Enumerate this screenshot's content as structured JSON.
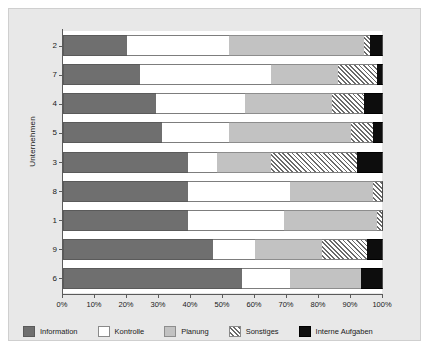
{
  "chart_data": {
    "type": "bar",
    "orientation": "horizontal",
    "stacked": true,
    "normalized": true,
    "title": "",
    "xlabel": "",
    "ylabel": "Unternehmen",
    "xlim": [
      0,
      100
    ],
    "xticks": [
      "0%",
      "10%",
      "20%",
      "30%",
      "40%",
      "50%",
      "60%",
      "70%",
      "80%",
      "90%",
      "100%"
    ],
    "xtick_values": [
      0,
      10,
      20,
      30,
      40,
      50,
      60,
      70,
      80,
      90,
      100
    ],
    "grid": false,
    "legend_position": "bottom",
    "categories": [
      "2",
      "7",
      "4",
      "5",
      "3",
      "8",
      "1",
      "9",
      "6"
    ],
    "series": [
      {
        "name": "Information",
        "color": "#6f6f6f",
        "pattern": "solid",
        "values": [
          20,
          24,
          29,
          31,
          39,
          39,
          39,
          47,
          56
        ]
      },
      {
        "name": "Kontrolle",
        "color": "#ffffff",
        "pattern": "solid",
        "values": [
          32,
          41,
          28,
          21,
          9,
          32,
          30,
          13,
          15
        ]
      },
      {
        "name": "Planung",
        "color": "#c2c2c2",
        "pattern": "solid",
        "values": [
          42,
          21,
          27,
          38,
          17,
          26,
          29,
          21,
          22
        ]
      },
      {
        "name": "Sonstiges",
        "color": "#ffffff",
        "pattern": "hatch",
        "values": [
          2,
          12,
          10,
          7,
          27,
          3,
          2,
          14,
          0
        ]
      },
      {
        "name": "Interne Aufgaben",
        "color": "#0d0d0d",
        "pattern": "solid",
        "values": [
          4,
          2,
          6,
          3,
          8,
          0,
          0,
          5,
          7
        ]
      }
    ]
  },
  "legend": {
    "items": [
      {
        "label": "Information",
        "key": "info"
      },
      {
        "label": "Kontrolle",
        "key": "kont"
      },
      {
        "label": "Planung",
        "key": "plan"
      },
      {
        "label": "Sonstiges",
        "key": "sonst"
      },
      {
        "label": "Interne Aufgaben",
        "key": "intern"
      }
    ]
  },
  "axes": {
    "y_title": "Unternehmen"
  }
}
